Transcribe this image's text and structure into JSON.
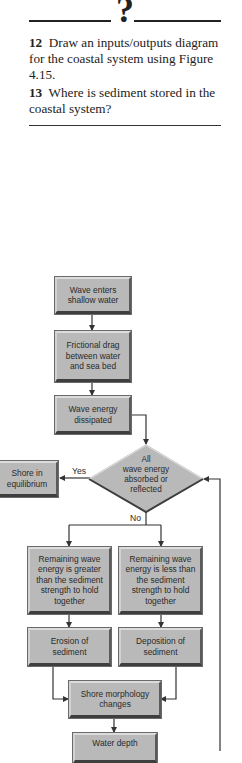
{
  "header": {
    "question_mark": "?"
  },
  "questions": [
    {
      "number": "12",
      "text": "Draw an inputs/outputs diagram for the coastal system using Figure 4.15."
    },
    {
      "number": "13",
      "text": "Where is sediment stored in the coastal system?"
    }
  ],
  "flowchart": {
    "nodes": {
      "wave_enters": [
        "Wave enters",
        "shallow water"
      ],
      "frictional_drag": [
        "Frictional drag",
        "between water",
        "and sea bed"
      ],
      "energy_dissipated": [
        "Wave energy",
        "dissipated"
      ],
      "decision": [
        "All",
        "wave energy",
        "absorbed or",
        "reflected"
      ],
      "equilibrium": [
        "Shore in",
        "equilibrium"
      ],
      "greater": [
        "Remaining wave",
        "energy is greater",
        "than the sediment",
        "strength to hold",
        "together"
      ],
      "less": [
        "Remaining wave",
        "energy is less than",
        "the sediment",
        "strength to hold",
        "together"
      ],
      "erosion": [
        "Erosion of",
        "sediment"
      ],
      "deposition": [
        "Deposition of",
        "sediment"
      ],
      "morphology": [
        "Shore morphology",
        "changes"
      ],
      "water_depth": [
        "Water depth"
      ]
    },
    "labels": {
      "yes": "Yes",
      "no": "No"
    },
    "colors": {
      "box_fill": "#b9b9b9",
      "line": "#333333"
    }
  }
}
